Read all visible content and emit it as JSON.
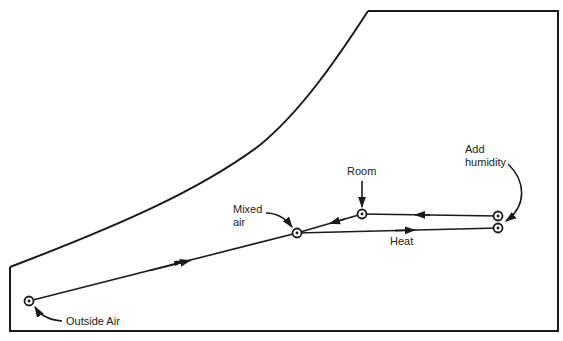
{
  "diagram": {
    "type": "psychrometric-process",
    "labels": {
      "outside_air": "Outside Air",
      "mixed_air_line1": "Mixed",
      "mixed_air_line2": "air",
      "room": "Room",
      "add_humidity_line1": "Add",
      "add_humidity_line2": "humidity",
      "heat": "Heat"
    },
    "points": [
      {
        "id": "outside_air",
        "x": 29,
        "y": 301
      },
      {
        "id": "mixed_air",
        "x": 297,
        "y": 233
      },
      {
        "id": "room",
        "x": 362,
        "y": 214
      },
      {
        "id": "after_humidify",
        "x": 498,
        "y": 216
      },
      {
        "id": "after_heat",
        "x": 498,
        "y": 228
      }
    ],
    "processes": [
      {
        "from": "outside_air",
        "to": "mixed_air"
      },
      {
        "from": "room",
        "to": "mixed_air"
      },
      {
        "from": "mixed_air",
        "to": "after_heat",
        "label": "Heat"
      },
      {
        "from": "after_heat",
        "to": "after_humidify",
        "label": "Add humidity"
      },
      {
        "from": "after_humidify",
        "to": "room"
      }
    ],
    "colors": {
      "ink": "#1a1a1a",
      "background": "#ffffff"
    }
  }
}
